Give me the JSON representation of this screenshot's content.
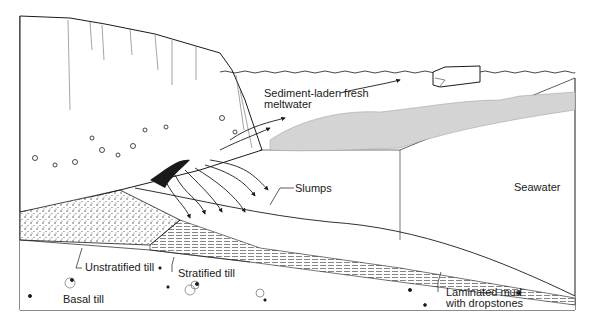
{
  "diagram": {
    "labels": {
      "meltwater": "Sediment-laden fresh\nmeltwater",
      "slumps": "Slumps",
      "seawater": "Seawater",
      "unstratified_till": "Unstratified till",
      "stratified_till": "Stratified till",
      "basal_till": "Basal till",
      "laminated_mud": "Laminated mud\nwith dropstones"
    },
    "colors": {
      "ink": "#1a1a1a",
      "plume_gray": "#d4d4d4",
      "background": "#ffffff"
    }
  }
}
